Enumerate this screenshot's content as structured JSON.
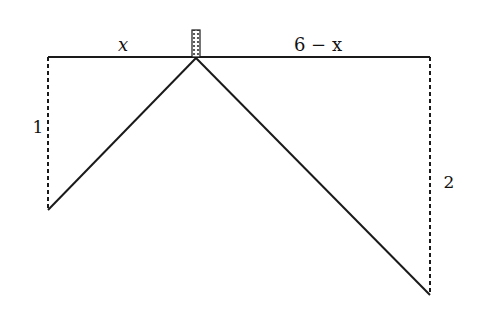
{
  "diagram": {
    "type": "geometry-figure",
    "colors": {
      "line": "#1a1a1a",
      "background": "#ffffff"
    },
    "labels": {
      "left_segment": "x",
      "right_segment": "6 − x",
      "left_height": "1",
      "right_height": "2"
    },
    "geometry": {
      "total_width": 6,
      "left_height": 1,
      "right_height": 2
    }
  }
}
